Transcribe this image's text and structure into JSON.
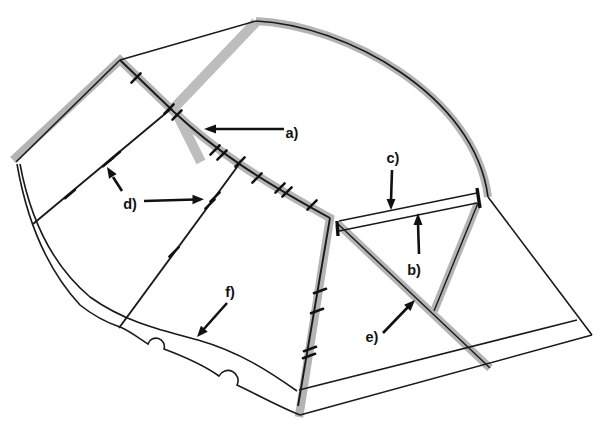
{
  "figure": {
    "type": "technical-pattern-diagram",
    "background": "#ffffff",
    "colors": {
      "line": "#1a1a1a",
      "seam_tape": "#b4b4b4"
    },
    "labels": {
      "a": "a)",
      "b": "b)",
      "c": "c)",
      "d": "d)",
      "e": "e)",
      "f": "f)"
    }
  }
}
